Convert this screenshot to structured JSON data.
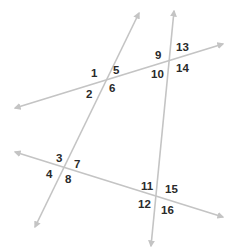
{
  "figure": {
    "line_color": "#c4c4c4",
    "label_color": "#2a2a2a",
    "lines": [
      {
        "id": "transversal-left",
        "x1": 139,
        "y1": 13,
        "x2": 35,
        "y2": 227
      },
      {
        "id": "transversal-right",
        "x1": 174,
        "y1": 11,
        "x2": 151,
        "y2": 246
      },
      {
        "id": "line-upper",
        "x1": 15,
        "y1": 108,
        "x2": 223,
        "y2": 44
      },
      {
        "id": "line-lower",
        "x1": 15,
        "y1": 152,
        "x2": 223,
        "y2": 217
      }
    ],
    "angle_labels": [
      {
        "text": "1",
        "x": 91,
        "y": 77
      },
      {
        "text": "2",
        "x": 86,
        "y": 98
      },
      {
        "text": "5",
        "x": 113,
        "y": 74
      },
      {
        "text": "6",
        "x": 109,
        "y": 92
      },
      {
        "text": "9",
        "x": 155,
        "y": 59
      },
      {
        "text": "10",
        "x": 151,
        "y": 78
      },
      {
        "text": "13",
        "x": 176,
        "y": 51
      },
      {
        "text": "14",
        "x": 176,
        "y": 72
      },
      {
        "text": "3",
        "x": 56,
        "y": 162
      },
      {
        "text": "4",
        "x": 46,
        "y": 178
      },
      {
        "text": "7",
        "x": 74,
        "y": 168
      },
      {
        "text": "8",
        "x": 65,
        "y": 183
      },
      {
        "text": "11",
        "x": 141,
        "y": 190
      },
      {
        "text": "12",
        "x": 138,
        "y": 208
      },
      {
        "text": "15",
        "x": 165,
        "y": 193
      },
      {
        "text": "16",
        "x": 161,
        "y": 214
      }
    ]
  }
}
